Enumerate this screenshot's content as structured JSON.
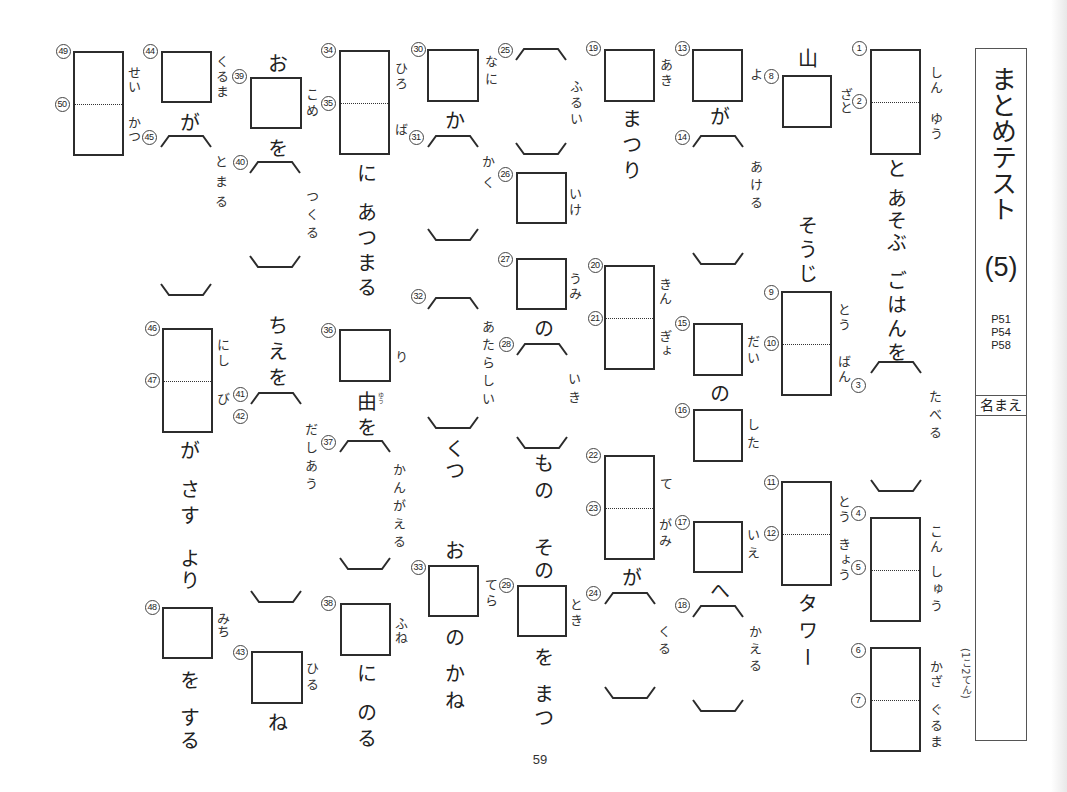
{
  "side_panel": {
    "title": "まとめテスト",
    "test_number": "(5)",
    "page_refs": [
      "P51",
      "P54",
      "P58"
    ],
    "name_label": "名まえ",
    "points_note": "(1こ2てん)"
  },
  "page_number": "59",
  "columns": [
    {
      "blanks": [
        {
          "kind": "box-split",
          "nums": [
            "1",
            "2"
          ],
          "readings": [
            "しん",
            "ゆう"
          ]
        },
        {
          "kind": "bracket",
          "nums": [
            "3"
          ],
          "readings": [
            "たべる"
          ]
        },
        {
          "kind": "box-split",
          "nums": [
            "4",
            "5"
          ],
          "readings": [
            "こん",
            "しゅう"
          ]
        },
        {
          "kind": "box-split",
          "nums": [
            "6",
            "7"
          ],
          "readings": [
            "かざ",
            "ぐるま"
          ]
        }
      ],
      "text": [
        "と",
        "あそぶ",
        "ごはんを"
      ]
    },
    {
      "blanks": [
        {
          "kind": "box",
          "nums": [
            "8"
          ],
          "readings": [
            "ざと"
          ]
        },
        {
          "kind": "box-split",
          "nums": [
            "9",
            "10"
          ],
          "readings": [
            "とう",
            "ばん"
          ]
        },
        {
          "kind": "box-split",
          "nums": [
            "11",
            "12"
          ],
          "readings": [
            "とう",
            "きょう"
          ]
        }
      ],
      "text": [
        "山",
        "そうじ",
        "タワー"
      ]
    },
    {
      "blanks": [
        {
          "kind": "box",
          "nums": [
            "13"
          ],
          "readings": [
            "よ"
          ]
        },
        {
          "kind": "bracket",
          "nums": [
            "14"
          ],
          "readings": [
            "あける"
          ]
        },
        {
          "kind": "box",
          "nums": [
            "15"
          ],
          "readings": [
            "だい"
          ]
        },
        {
          "kind": "box",
          "nums": [
            "16"
          ],
          "readings": [
            "した"
          ]
        },
        {
          "kind": "box",
          "nums": [
            "17"
          ],
          "readings": [
            "いえ"
          ]
        },
        {
          "kind": "bracket",
          "nums": [
            "18"
          ],
          "readings": [
            "かえる"
          ]
        }
      ],
      "text": [
        "が",
        "の",
        "へ"
      ]
    },
    {
      "blanks": [
        {
          "kind": "box",
          "nums": [
            "19"
          ],
          "readings": [
            "あき"
          ]
        },
        {
          "kind": "box-split",
          "nums": [
            "20",
            "21"
          ],
          "readings": [
            "きん",
            "ぎょ"
          ]
        },
        {
          "kind": "box-split",
          "nums": [
            "22",
            "23"
          ],
          "readings": [
            "て",
            "がみ"
          ]
        },
        {
          "kind": "bracket",
          "nums": [
            "24"
          ],
          "readings": [
            "くる"
          ]
        }
      ],
      "text": [
        "まつり",
        "が"
      ]
    },
    {
      "blanks": [
        {
          "kind": "bracket",
          "nums": [
            "25"
          ],
          "readings": [
            "ふるい"
          ]
        },
        {
          "kind": "box",
          "nums": [
            "26"
          ],
          "readings": [
            "いけ"
          ]
        },
        {
          "kind": "box",
          "nums": [
            "27"
          ],
          "readings": [
            "うみ"
          ]
        },
        {
          "kind": "bracket",
          "nums": [
            "28"
          ],
          "readings": [
            "いき"
          ]
        },
        {
          "kind": "box",
          "nums": [
            "29"
          ],
          "readings": [
            "とき"
          ]
        }
      ],
      "text": [
        "の",
        "もの",
        "その",
        "を",
        "まつ"
      ]
    },
    {
      "blanks": [
        {
          "kind": "box",
          "nums": [
            "30"
          ],
          "readings": [
            "なに"
          ]
        },
        {
          "kind": "bracket",
          "nums": [
            "31"
          ],
          "readings": [
            "かく"
          ]
        },
        {
          "kind": "bracket",
          "nums": [
            "32"
          ],
          "readings": [
            "あたらしい"
          ]
        },
        {
          "kind": "box",
          "nums": [
            "33"
          ],
          "readings": [
            "てら"
          ]
        }
      ],
      "text": [
        "か",
        "くつ",
        "お",
        "の",
        "かね"
      ]
    },
    {
      "blanks": [
        {
          "kind": "box-split",
          "nums": [
            "34",
            "35"
          ],
          "readings": [
            "ひろ",
            "ば"
          ]
        },
        {
          "kind": "box",
          "nums": [
            "36"
          ],
          "readings": [
            "り"
          ]
        },
        {
          "kind": "bracket",
          "nums": [
            "37"
          ],
          "readings": [
            "かんがえる"
          ]
        },
        {
          "kind": "box",
          "nums": [
            "38"
          ],
          "readings": [
            "ふね"
          ]
        }
      ],
      "text": [
        "に",
        "あつまる",
        "由",
        "を",
        "に",
        "のる"
      ],
      "furigana": "ゆう"
    },
    {
      "blanks": [
        {
          "kind": "box",
          "nums": [
            "39"
          ],
          "readings": [
            "こめ"
          ]
        },
        {
          "kind": "bracket",
          "nums": [
            "40"
          ],
          "readings": [
            "つくる"
          ]
        },
        {
          "kind": "bracket",
          "nums": [
            "41",
            "42"
          ],
          "readings": [
            "だしあう"
          ]
        },
        {
          "kind": "box",
          "nums": [
            "43"
          ],
          "readings": [
            "ひる"
          ]
        }
      ],
      "text": [
        "お",
        "を",
        "ちえを",
        "ね"
      ]
    },
    {
      "blanks": [
        {
          "kind": "box",
          "nums": [
            "44"
          ],
          "readings": [
            "くるま"
          ]
        },
        {
          "kind": "bracket",
          "nums": [
            "45"
          ],
          "readings": [
            "とまる"
          ]
        },
        {
          "kind": "box-split",
          "nums": [
            "46",
            "47"
          ],
          "readings": [
            "にし",
            "び"
          ]
        },
        {
          "kind": "box",
          "nums": [
            "48"
          ],
          "readings": [
            "みち"
          ]
        }
      ],
      "text": [
        "が",
        "が",
        "さす",
        "より",
        "を",
        "する"
      ]
    },
    {
      "blanks": [
        {
          "kind": "box-split",
          "nums": [
            "49",
            "50"
          ],
          "readings": [
            "せい",
            "かつ"
          ]
        }
      ],
      "text": []
    }
  ]
}
